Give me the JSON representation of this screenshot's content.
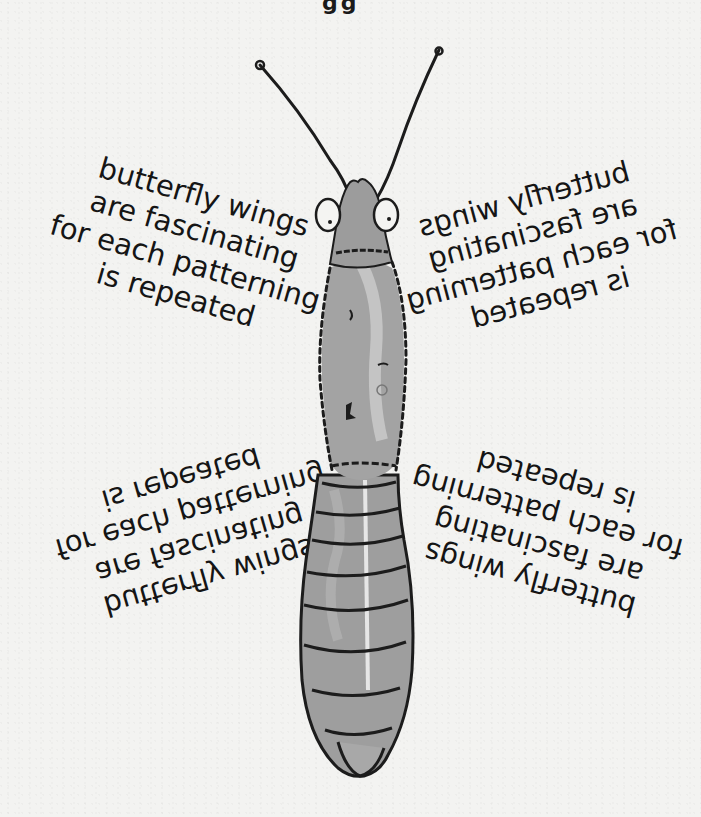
{
  "illustration": {
    "subject": "segmented insect drawing with antennae",
    "icon": "insect-illustration",
    "colors": {
      "body_fill": "#9a9a9a",
      "body_highlight": "#c8c8c8",
      "outline": "#1c1c1c",
      "paper": "#f3f3f1",
      "text": "#151515"
    }
  },
  "top_fragment": {
    "text": "gg"
  },
  "poems": {
    "top_left": {
      "orientation": "normal",
      "lines": [
        "butterfly wings",
        "are fascinating",
        "for each patterning",
        "is repeated"
      ]
    },
    "top_right": {
      "orientation": "mirrored",
      "lines": [
        "butterfly wings",
        "are fascinating",
        "for each patterning",
        "is repeated"
      ]
    },
    "bottom_left": {
      "orientation": "flipped-vertical",
      "lines": [
        "butterfly wings",
        "are fascinating",
        "for each patterning",
        "is repeated"
      ]
    },
    "bottom_right": {
      "orientation": "rotated-180",
      "lines": [
        "butterfly wings",
        "are fascinating",
        "for each patterning",
        "is repeated"
      ]
    }
  }
}
